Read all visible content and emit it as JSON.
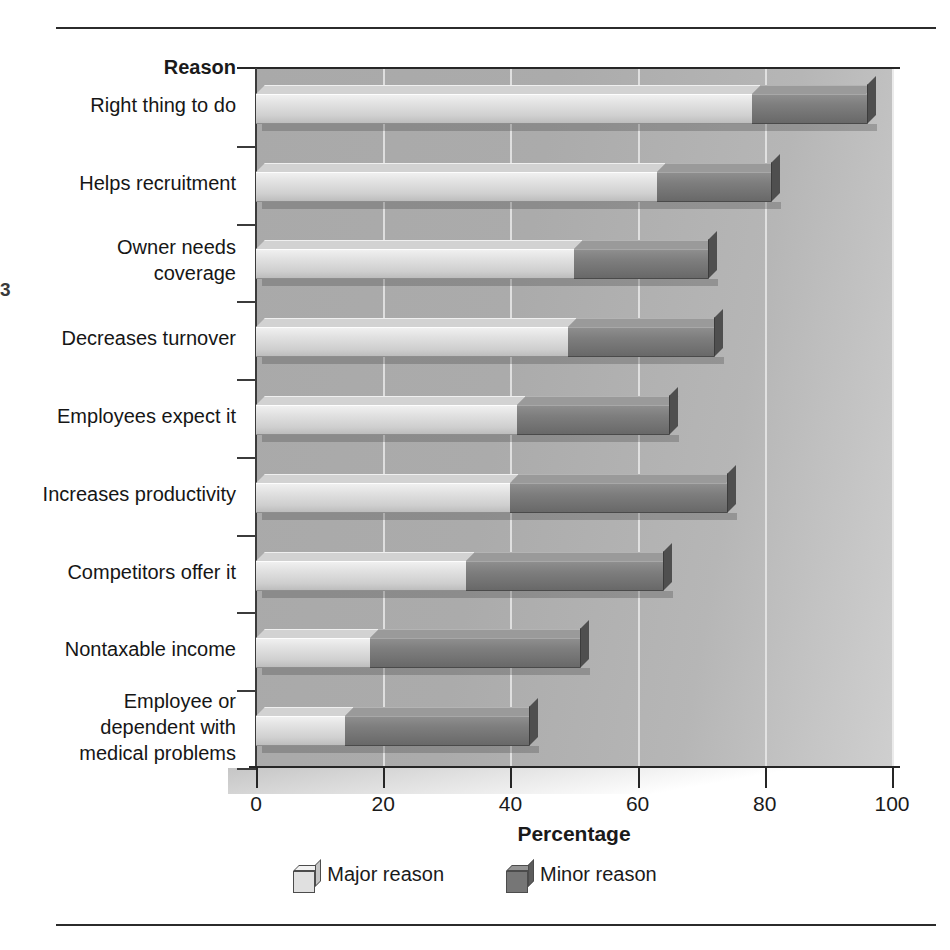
{
  "margin_mark": "3",
  "axis": {
    "y_title": "Reason",
    "x_title": "Percentage",
    "x_ticks": [
      0,
      20,
      40,
      60,
      80,
      100
    ]
  },
  "legend": {
    "items": [
      {
        "label": "Major reason",
        "swatch": "cube-light",
        "color": "#e0e0e0"
      },
      {
        "label": "Minor reason",
        "swatch": "cube-dark",
        "color": "#767676"
      }
    ]
  },
  "chart_data": {
    "type": "bar",
    "orientation": "horizontal",
    "stacked": true,
    "title": "",
    "xlabel": "Percentage",
    "ylabel": "Reason",
    "xlim": [
      0,
      100
    ],
    "grid": true,
    "legend_position": "bottom",
    "categories": [
      "Right thing to do",
      "Helps recruitment",
      "Owner needs\ncoverage",
      "Decreases turnover",
      "Employees expect it",
      "Increases productivity",
      "Competitors offer it",
      "Nontaxable income",
      "Employee or\ndependent with\nmedical problems"
    ],
    "series": [
      {
        "name": "Major reason",
        "color": "#e0e0e0",
        "values": [
          78,
          63,
          50,
          49,
          41,
          40,
          33,
          18,
          14
        ]
      },
      {
        "name": "Minor reason",
        "color": "#767676",
        "values": [
          18,
          18,
          21,
          23,
          24,
          34,
          31,
          33,
          29
        ]
      }
    ],
    "totals": [
      96,
      81,
      71,
      72,
      65,
      74,
      64,
      51,
      43
    ]
  }
}
